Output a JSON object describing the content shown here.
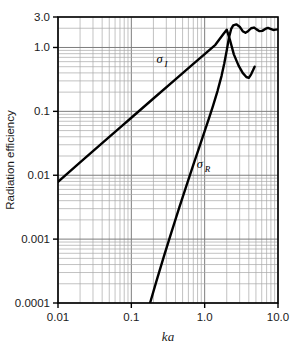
{
  "chart_data": {
    "type": "line",
    "title": "",
    "xlabel": "ka",
    "ylabel": "Radiation efficiency",
    "xscale": "log",
    "yscale": "log",
    "xlim": [
      0.01,
      10.0
    ],
    "ylim": [
      0.0001,
      3.0
    ],
    "grid": "both-minor-log",
    "legend": "inline-annotations",
    "xticks": [
      {
        "value": 0.01,
        "label": "0.01"
      },
      {
        "value": 0.1,
        "label": "0.1"
      },
      {
        "value": 1.0,
        "label": "1.0"
      },
      {
        "value": 10.0,
        "label": "10.0"
      }
    ],
    "yticks": [
      {
        "value": 3.0,
        "label": "3.0"
      },
      {
        "value": 1.0,
        "label": "1.0"
      },
      {
        "value": 0.1,
        "label": "0.1"
      },
      {
        "value": 0.01,
        "label": "0.01"
      },
      {
        "value": 0.001,
        "label": "0.001"
      },
      {
        "value": 0.0001,
        "label": "0.0001"
      }
    ],
    "series": [
      {
        "name": "sigma_I",
        "label_base": "σ",
        "label_sub": "I",
        "label_at": [
          0.22,
          0.58
        ],
        "points": [
          [
            0.01,
            0.0079
          ],
          [
            0.02,
            0.0159
          ],
          [
            0.04,
            0.0318
          ],
          [
            0.07,
            0.0556
          ],
          [
            0.1,
            0.0794
          ],
          [
            0.2,
            0.159
          ],
          [
            0.4,
            0.317
          ],
          [
            0.7,
            0.553
          ],
          [
            1.0,
            0.788
          ],
          [
            1.4,
            1.1
          ],
          [
            1.8,
            1.62
          ],
          [
            2.0,
            1.9
          ],
          [
            2.2,
            1.34
          ],
          [
            2.5,
            0.78
          ],
          [
            2.9,
            0.52
          ],
          [
            3.3,
            0.4
          ],
          [
            3.7,
            0.345
          ],
          [
            4.0,
            0.335
          ],
          [
            4.3,
            0.38
          ],
          [
            4.6,
            0.45
          ],
          [
            4.8,
            0.5
          ]
        ]
      },
      {
        "name": "sigma_R",
        "label_base": "σ",
        "label_sub": "R",
        "label_at": [
          0.78,
          0.013
        ],
        "points": [
          [
            0.18,
            0.0001
          ],
          [
            0.22,
            0.00022
          ],
          [
            0.28,
            0.00055
          ],
          [
            0.35,
            0.00125
          ],
          [
            0.45,
            0.0031
          ],
          [
            0.55,
            0.0063
          ],
          [
            0.7,
            0.0145
          ],
          [
            0.85,
            0.028
          ],
          [
            1.0,
            0.049
          ],
          [
            1.15,
            0.079
          ],
          [
            1.3,
            0.122
          ],
          [
            1.5,
            0.21
          ],
          [
            1.7,
            0.36
          ],
          [
            1.85,
            0.56
          ],
          [
            2.0,
            0.9
          ],
          [
            2.15,
            1.45
          ],
          [
            2.3,
            1.95
          ],
          [
            2.45,
            2.22
          ],
          [
            2.7,
            2.3
          ],
          [
            3.0,
            2.12
          ],
          [
            3.3,
            1.8
          ],
          [
            3.6,
            1.7
          ],
          [
            3.9,
            1.8
          ],
          [
            4.3,
            2.0
          ],
          [
            4.7,
            2.05
          ],
          [
            5.1,
            1.92
          ],
          [
            5.6,
            1.8
          ],
          [
            6.1,
            1.82
          ],
          [
            6.7,
            1.95
          ],
          [
            7.3,
            2.02
          ],
          [
            7.9,
            1.95
          ],
          [
            8.6,
            1.88
          ],
          [
            9.3,
            1.9
          ],
          [
            10.0,
            1.92
          ]
        ]
      }
    ]
  }
}
